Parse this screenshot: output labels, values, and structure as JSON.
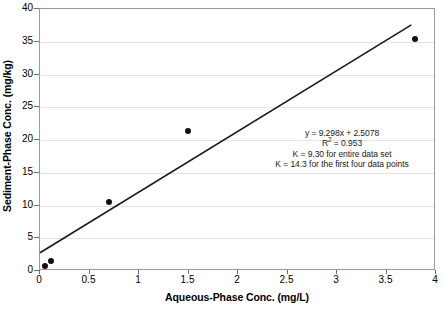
{
  "chart_data": {
    "type": "scatter",
    "title": "",
    "xlabel": "Aqueous-Phase Conc. (mg/L)",
    "ylabel": "Sediment-Phase Conc.  (mg/kg)",
    "xlim": [
      0,
      4
    ],
    "ylim": [
      0,
      40
    ],
    "xticks": [
      "0",
      "0.5",
      "1",
      "1.5",
      "2",
      "2.5",
      "3",
      "3.5",
      "4"
    ],
    "xtick_values": [
      0,
      0.5,
      1,
      1.5,
      2,
      2.5,
      3,
      3.5,
      4
    ],
    "yticks": [
      "0",
      "5",
      "10",
      "15",
      "20",
      "25",
      "30",
      "35",
      "40"
    ],
    "ytick_values": [
      0,
      5,
      10,
      15,
      20,
      25,
      30,
      35,
      40
    ],
    "grid": "horizontal",
    "legend": "none",
    "marker": "filled-circle",
    "marker_color": "#101010",
    "points": [
      {
        "x": 0.05,
        "y": 0.8
      },
      {
        "x": 0.11,
        "y": 1.5
      },
      {
        "x": 0.7,
        "y": 10.5
      },
      {
        "x": 1.49,
        "y": 21.3
      },
      {
        "x": 3.79,
        "y": 35.4
      }
    ],
    "trendline": {
      "type": "linear",
      "slope": 9.298,
      "intercept": 2.5078,
      "color": "#1a1a1a",
      "x_start": 0.0,
      "x_end": 3.77
    },
    "annotations": {
      "equation_prefix": "y = 9.298x + 2.5078",
      "r_squared_label": "R",
      "r_squared_exponent": "2",
      "r_squared_value": " = 0.953",
      "k_entire": "K = 9.30 for entire data set",
      "k_first_four": "K = 14.3 for the first four data points"
    }
  }
}
